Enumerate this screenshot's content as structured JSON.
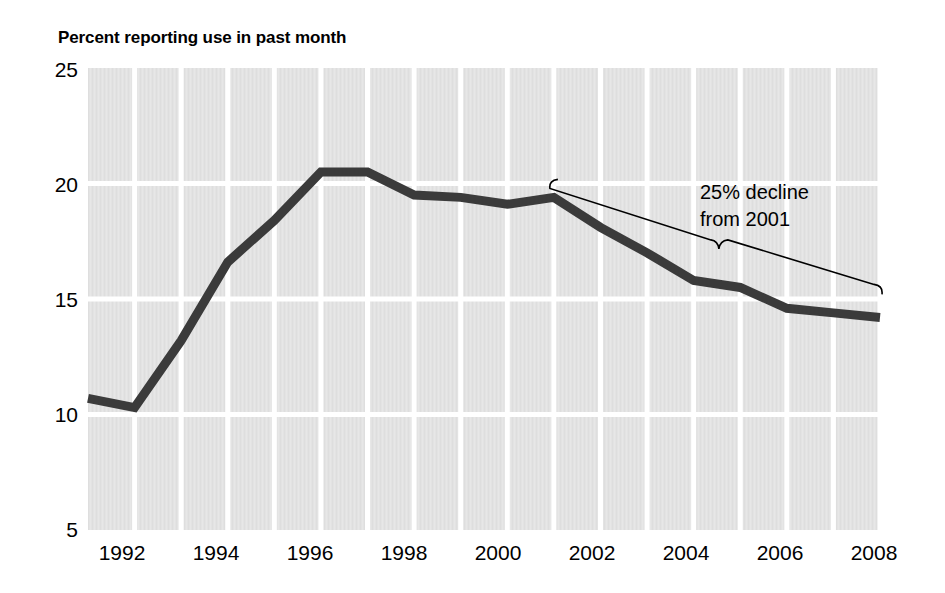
{
  "chart_data": {
    "type": "line",
    "title": "Percent reporting use in past month",
    "xlabel": "",
    "ylabel": "",
    "ylim": [
      5,
      25
    ],
    "xlim": [
      1991,
      2008
    ],
    "yticks": [
      "5",
      "10",
      "15",
      "20",
      "25"
    ],
    "ytick_values": [
      5,
      10,
      15,
      20,
      25
    ],
    "xticks": [
      "1992",
      "1994",
      "1996",
      "1998",
      "2000",
      "2002",
      "2004",
      "2006",
      "2008"
    ],
    "xtick_values": [
      1992,
      1994,
      1996,
      1998,
      2000,
      2002,
      2004,
      2006,
      2008
    ],
    "grid": true,
    "legend": "none",
    "line_color": "#3b3b3b",
    "plot_background": "#e3e3e3",
    "gridline_color": "#ffffff",
    "x": [
      1991,
      1992,
      1993,
      1994,
      1995,
      1996,
      1997,
      1998,
      1999,
      2000,
      2001,
      2002,
      2003,
      2004,
      2005,
      2006,
      2007,
      2008
    ],
    "values": [
      10.7,
      10.3,
      13.2,
      16.6,
      18.4,
      20.5,
      20.5,
      19.5,
      19.4,
      19.1,
      19.4,
      18.1,
      17.0,
      15.8,
      15.5,
      14.6,
      14.4,
      14.2
    ],
    "annotations": [
      {
        "name": "decline-callout",
        "text_lines": [
          "25% decline",
          "from 2001"
        ],
        "brace_from_year": 2001,
        "brace_from_value": 19.4,
        "brace_to_year": 2008,
        "brace_to_value": 15.2
      }
    ]
  },
  "annotation_text": {
    "line1": "25% decline",
    "line2": "from 2001"
  }
}
